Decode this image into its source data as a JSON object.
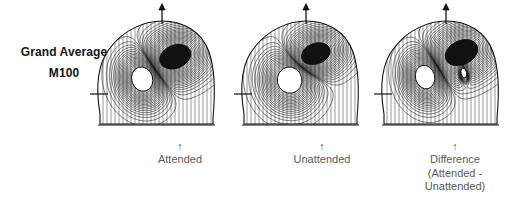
{
  "figure": {
    "background_color": "#ffffff",
    "ink_color": "#111111",
    "caption_color": "#5a5a5a",
    "row_label": {
      "line1": "Grand Average",
      "line2": "M100"
    },
    "panels": [
      {
        "id": "attended",
        "caption_arrow": "↑",
        "caption_lines": [
          "Attended"
        ],
        "nose_marker": "up-arrow",
        "ear_marker": "left-tick"
      },
      {
        "id": "unattended",
        "caption_arrow": "↑",
        "caption_lines": [
          "Unattended"
        ],
        "nose_marker": "up-arrow",
        "ear_marker": "left-tick"
      },
      {
        "id": "difference",
        "caption_arrow": "↑",
        "caption_lines": [
          "Difference",
          "(Attended -",
          "Unattended)"
        ],
        "nose_marker": "up-arrow",
        "ear_marker": "left-tick"
      }
    ]
  },
  "chart_data": {
    "type": "heatmap",
    "title": "Grand Average M100",
    "subtitle": "",
    "xlabel": "",
    "ylabel": "",
    "render_style": "isofield-contour-map",
    "grid": false,
    "legend": false,
    "legend_position": "none",
    "panel_labels": [
      "Attended",
      "Unattended",
      "Difference (Attended - Unattended)"
    ],
    "panels": [
      {
        "name": "Attended",
        "extrema": [
          {
            "polarity": "outgoing",
            "fill": "white",
            "cx_frac": 0.37,
            "cy_frac": 0.56,
            "rx_frac": 0.115,
            "ry_frac": 0.155,
            "rot_deg": -18
          },
          {
            "polarity": "ingoing",
            "fill": "black",
            "cx_frac": 0.66,
            "cy_frac": 0.34,
            "rx_frac": 0.175,
            "ry_frac": 0.145,
            "rot_deg": -22
          }
        ],
        "contour_count": 26,
        "dipole_axis_deg": -35
      },
      {
        "name": "Unattended",
        "extrema": [
          {
            "polarity": "outgoing",
            "fill": "white",
            "cx_frac": 0.4,
            "cy_frac": 0.57,
            "rx_frac": 0.135,
            "ry_frac": 0.165,
            "rot_deg": -12
          },
          {
            "polarity": "ingoing",
            "fill": "black",
            "cx_frac": 0.63,
            "cy_frac": 0.31,
            "rx_frac": 0.16,
            "ry_frac": 0.13,
            "rot_deg": -20
          }
        ],
        "contour_count": 24,
        "dipole_axis_deg": -38
      },
      {
        "name": "Difference (Attended - Unattended)",
        "extrema": [
          {
            "polarity": "outgoing",
            "fill": "white",
            "cx_frac": 0.36,
            "cy_frac": 0.54,
            "rx_frac": 0.105,
            "ry_frac": 0.15,
            "rot_deg": -15
          },
          {
            "polarity": "ingoing",
            "fill": "black",
            "cx_frac": 0.68,
            "cy_frac": 0.3,
            "rx_frac": 0.185,
            "ry_frac": 0.15,
            "rot_deg": -25
          },
          {
            "polarity": "outgoing-secondary",
            "fill": "white",
            "cx_frac": 0.7,
            "cy_frac": 0.5,
            "rx_frac": 0.03,
            "ry_frac": 0.06,
            "rot_deg": -10
          }
        ],
        "contour_count": 25,
        "dipole_axis_deg": -32
      }
    ]
  }
}
